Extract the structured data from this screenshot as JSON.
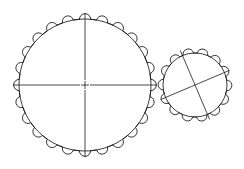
{
  "drawing": {
    "title": "Meshing Gear Pair",
    "type": "engineering-line-drawing",
    "background_color": "#ffffff",
    "line_color": "#1a1a1a",
    "line_width": 0.9,
    "canvas": {
      "width": 244,
      "height": 169
    }
  },
  "gears": [
    {
      "name": "large-gear",
      "label": "Large Gear",
      "center_x": 85,
      "center_y": 85,
      "root_radius": 66,
      "tip_radius": 72,
      "tooth_count": 24,
      "tooth_profile": "rounded-semicircular",
      "tooth_radius": 5.6,
      "phase_deg": -90,
      "centerlines": {
        "style": "crosshair",
        "rotation_deg": 0,
        "horizontal_extent": 72,
        "vertical_extent": 72,
        "gap_radius": 5
      }
    },
    {
      "name": "small-gear",
      "label": "Small Gear",
      "center_x": 195,
      "center_y": 85,
      "root_radius": 32,
      "tip_radius": 37.5,
      "tooth_count": 14,
      "tooth_profile": "rounded-semicircular",
      "tooth_radius": 5.3,
      "phase_deg": 155,
      "centerlines": {
        "style": "crosshair",
        "rotation_deg": -23,
        "horizontal_extent": 37.5,
        "vertical_extent": 37.5,
        "gap_radius": 4
      }
    }
  ],
  "mesh": {
    "name": "mesh-point",
    "x": 156,
    "y": 85,
    "description": "tangent contact between large and small gear pitch circles"
  }
}
